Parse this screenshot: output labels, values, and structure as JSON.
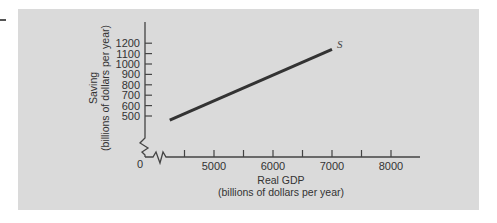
{
  "chart_data": {
    "type": "line",
    "title": "",
    "xlabel": "Real GDP",
    "xlabel_sub": "(billions of dollars per year)",
    "ylabel": "Saving",
    "ylabel_sub": "(billions of dollars per year)",
    "x_ticks": [
      5000,
      6000,
      7000,
      8000
    ],
    "x_tick_labels": [
      "5000",
      "6000",
      "7000",
      "8000"
    ],
    "x_minor_ticks": [
      4500,
      5500,
      6500,
      7500
    ],
    "y_ticks": [
      500,
      600,
      700,
      800,
      900,
      1000,
      1100,
      1200
    ],
    "y_tick_labels": [
      "500",
      "600",
      "700",
      "800",
      "900",
      "1000",
      "1100",
      "1200"
    ],
    "origin_label": "0",
    "axis_breaks": {
      "x": true,
      "y": true
    },
    "xlim": [
      4000,
      8500
    ],
    "ylim": [
      0,
      1300
    ],
    "grid": false,
    "legend": null,
    "series": [
      {
        "name": "S",
        "label": "S",
        "color": "#333333",
        "x": [
          4250,
          7000
        ],
        "y": [
          460,
          1140
        ]
      }
    ]
  },
  "colors": {
    "panel_bg": "#dadada",
    "axis": "#444444",
    "line": "#333333"
  }
}
